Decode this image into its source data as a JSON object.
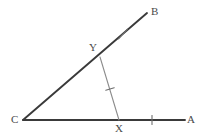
{
  "figure": {
    "name": "angle-with-congruent-segments",
    "width": 206,
    "height": 138,
    "background_color": "#ffffff",
    "stroke_colors": {
      "ray_primary": "#3a3a3a",
      "segment_secondary": "#8c8c8c",
      "tick_mark": "#6e6e6e",
      "label_text": "#4a4a4a"
    },
    "points": [
      {
        "id": "C",
        "label": "C",
        "x": 23,
        "y": 120,
        "role": "vertex"
      },
      {
        "id": "A",
        "label": "A",
        "x": 185,
        "y": 120,
        "role": "ray-endpoint"
      },
      {
        "id": "B",
        "label": "B",
        "x": 147,
        "y": 13,
        "role": "ray-endpoint"
      },
      {
        "id": "X",
        "label": "X",
        "x": 119,
        "y": 120,
        "role": "point-on-ray-CA"
      },
      {
        "id": "Y",
        "label": "Y",
        "x": 100,
        "y": 57,
        "role": "point-on-ray-CB"
      }
    ],
    "segments": [
      {
        "id": "CA",
        "from": "C",
        "to": "A",
        "style": "primary"
      },
      {
        "id": "CB",
        "from": "C",
        "to": "B",
        "style": "primary"
      },
      {
        "id": "YX",
        "from": "Y",
        "to": "X",
        "style": "secondary"
      }
    ],
    "tick_marks": [
      {
        "id": "tick-YB",
        "on": "YB",
        "x": 123,
        "y": 34,
        "count": 1
      },
      {
        "id": "tick-YX",
        "on": "YX",
        "x": 110,
        "y": 89,
        "count": 1
      },
      {
        "id": "tick-XA",
        "on": "XA",
        "x": 152,
        "y": 120,
        "count": 1
      }
    ],
    "labels": {
      "A": "A",
      "B": "B",
      "C": "C",
      "X": "X",
      "Y": "Y"
    }
  }
}
